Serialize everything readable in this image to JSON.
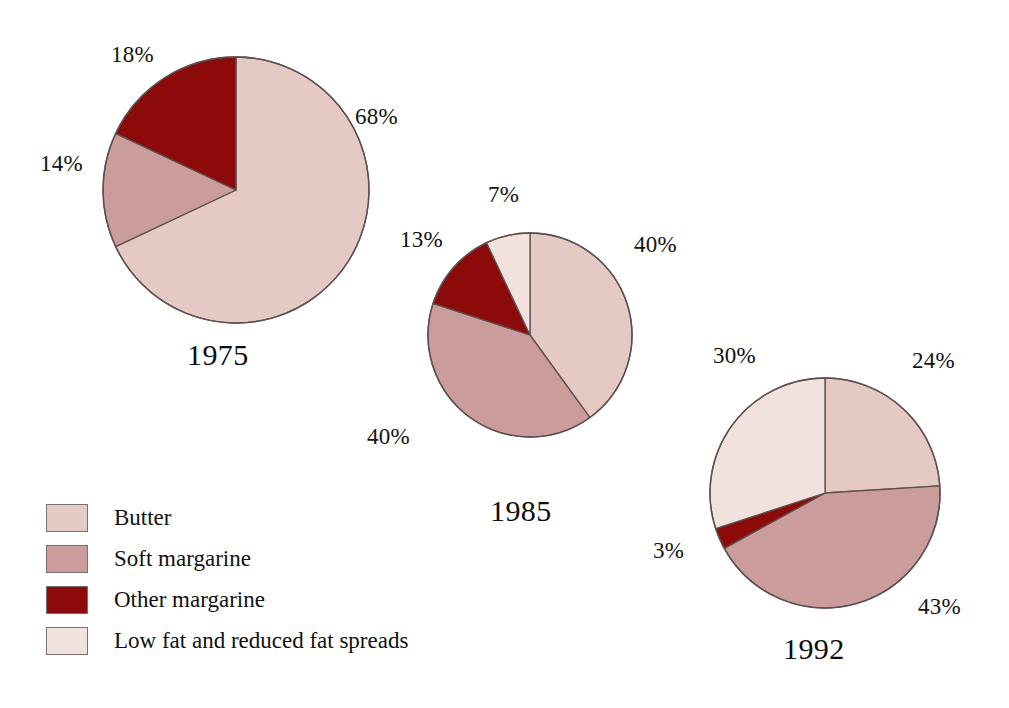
{
  "chart_data": [
    {
      "type": "pie",
      "title": "1975",
      "categories": [
        "Butter",
        "Soft margarine",
        "Other margarine",
        "Low fat and reduced fat spreads"
      ],
      "values": [
        68,
        14,
        18,
        0
      ],
      "labels": [
        "68%",
        "14%",
        "18%",
        ""
      ],
      "colors": [
        "#e5c9c5",
        "#cb9c9c",
        "#8c0a0a",
        "#f2e2de"
      ],
      "start_angle_deg": 0,
      "direction": "clockwise",
      "legend_position": "bottom-left",
      "grid": false,
      "xlabel": "",
      "ylabel": ""
    },
    {
      "type": "pie",
      "title": "1985",
      "categories": [
        "Butter",
        "Soft margarine",
        "Other margarine",
        "Low fat and reduced fat spreads"
      ],
      "values": [
        40,
        40,
        13,
        7
      ],
      "labels": [
        "40%",
        "40%",
        "13%",
        "7%"
      ],
      "colors": [
        "#e5c9c5",
        "#cb9c9c",
        "#8c0a0a",
        "#f2e2de"
      ],
      "start_angle_deg": 0,
      "direction": "clockwise",
      "legend_position": "bottom-left",
      "grid": false,
      "xlabel": "",
      "ylabel": ""
    },
    {
      "type": "pie",
      "title": "1992",
      "categories": [
        "Butter",
        "Soft margarine",
        "Other margarine",
        "Low fat and reduced fat spreads"
      ],
      "values": [
        24,
        43,
        3,
        30
      ],
      "labels": [
        "24%",
        "43%",
        "3%",
        "30%"
      ],
      "colors": [
        "#e5c9c5",
        "#cb9c9c",
        "#8c0a0a",
        "#f2e2de"
      ],
      "start_angle_deg": 0,
      "direction": "clockwise",
      "legend_position": "bottom-left",
      "grid": false,
      "xlabel": "",
      "ylabel": ""
    }
  ],
  "charts": {
    "pie1975": {
      "year": "1975",
      "pct_butter": "68%",
      "pct_soft": "14%",
      "pct_other": "18%"
    },
    "pie1985": {
      "year": "1985",
      "pct_butter": "40%",
      "pct_soft": "40%",
      "pct_other": "13%",
      "pct_lowfat": "7%"
    },
    "pie1992": {
      "year": "1992",
      "pct_butter": "24%",
      "pct_soft": "43%",
      "pct_other": "3%",
      "pct_lowfat": "30%"
    }
  },
  "legend": {
    "items": [
      {
        "label": "Butter",
        "color": "#e5c9c5"
      },
      {
        "label": "Soft margarine",
        "color": "#cb9c9c"
      },
      {
        "label": "Other margarine",
        "color": "#8c0a0a"
      },
      {
        "label": "Low fat and reduced fat spreads",
        "color": "#f2e2de"
      }
    ]
  },
  "colors": {
    "butter": "#e5c9c5",
    "soft_margarine": "#cb9c9c",
    "other_margarine": "#8c0a0a",
    "low_fat": "#f2e2de",
    "outline": "#5d5050",
    "background": "#ffffff",
    "text": "#111111"
  }
}
